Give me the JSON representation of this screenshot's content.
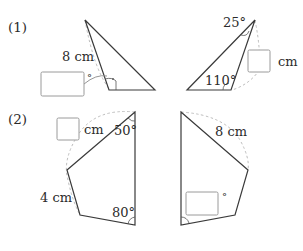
{
  "problems": [
    {
      "label": "(1)",
      "left_figure": {
        "side_label": "8 cm",
        "answer_box_unit": "°",
        "answer_box_value": ""
      },
      "right_figure": {
        "top_angle": "25°",
        "left_angle": "110°",
        "answer_box_unit": "cm",
        "answer_box_value": ""
      }
    },
    {
      "label": "(2)",
      "left_figure": {
        "top_angle": "50°",
        "bottom_angle": "80°",
        "side_label": "4 cm",
        "answer_box_unit": "cm",
        "answer_box_value": ""
      },
      "right_figure": {
        "side_label": "8 cm",
        "answer_box_unit": "°",
        "answer_box_value": ""
      }
    }
  ],
  "colors": {
    "figure_stroke": "#3a3a3a",
    "dashed_arc": "#bdbdbd",
    "answer_box_border": "#9a9a9a",
    "text": "#2b2b2b"
  }
}
